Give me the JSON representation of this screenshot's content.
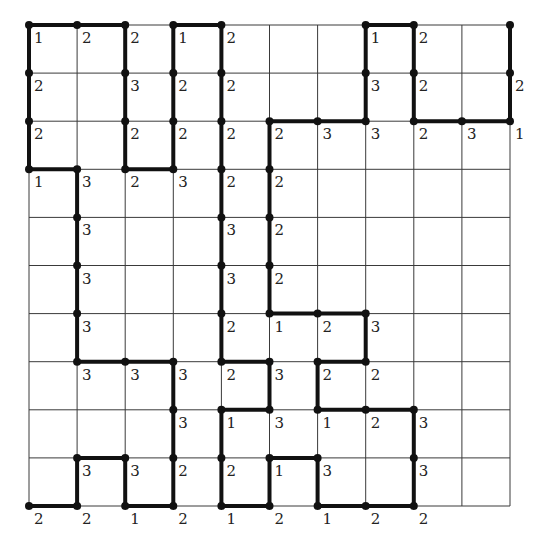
{
  "puzzle": {
    "type": "slitherlink-vertex-clues",
    "cols": 10,
    "rows": 10,
    "origin": [
      29,
      25
    ],
    "cell_size": 48.1,
    "colors": {
      "grid": "#3a3a3a",
      "path": "#111111",
      "text": "#222222",
      "background": "#ffffff"
    },
    "clues": [
      {
        "r": 0,
        "c": 0,
        "v": "1"
      },
      {
        "r": 0,
        "c": 1,
        "v": "2"
      },
      {
        "r": 0,
        "c": 2,
        "v": "2"
      },
      {
        "r": 0,
        "c": 3,
        "v": "1"
      },
      {
        "r": 0,
        "c": 4,
        "v": "2"
      },
      {
        "r": 0,
        "c": 7,
        "v": "1"
      },
      {
        "r": 0,
        "c": 8,
        "v": "2"
      },
      {
        "r": 1,
        "c": 0,
        "v": "2"
      },
      {
        "r": 1,
        "c": 2,
        "v": "3"
      },
      {
        "r": 1,
        "c": 3,
        "v": "2"
      },
      {
        "r": 1,
        "c": 4,
        "v": "2"
      },
      {
        "r": 1,
        "c": 7,
        "v": "3"
      },
      {
        "r": 1,
        "c": 8,
        "v": "2"
      },
      {
        "r": 1,
        "c": 10,
        "v": "2"
      },
      {
        "r": 2,
        "c": 0,
        "v": "2"
      },
      {
        "r": 2,
        "c": 2,
        "v": "2"
      },
      {
        "r": 2,
        "c": 3,
        "v": "2"
      },
      {
        "r": 2,
        "c": 4,
        "v": "2"
      },
      {
        "r": 2,
        "c": 5,
        "v": "2"
      },
      {
        "r": 2,
        "c": 6,
        "v": "3"
      },
      {
        "r": 2,
        "c": 7,
        "v": "3"
      },
      {
        "r": 2,
        "c": 8,
        "v": "2"
      },
      {
        "r": 2,
        "c": 9,
        "v": "3"
      },
      {
        "r": 2,
        "c": 10,
        "v": "1"
      },
      {
        "r": 3,
        "c": 0,
        "v": "1"
      },
      {
        "r": 3,
        "c": 1,
        "v": "3"
      },
      {
        "r": 3,
        "c": 2,
        "v": "2"
      },
      {
        "r": 3,
        "c": 3,
        "v": "3"
      },
      {
        "r": 3,
        "c": 4,
        "v": "2"
      },
      {
        "r": 3,
        "c": 5,
        "v": "2"
      },
      {
        "r": 4,
        "c": 1,
        "v": "3"
      },
      {
        "r": 4,
        "c": 4,
        "v": "3"
      },
      {
        "r": 4,
        "c": 5,
        "v": "2"
      },
      {
        "r": 5,
        "c": 1,
        "v": "3"
      },
      {
        "r": 5,
        "c": 4,
        "v": "3"
      },
      {
        "r": 5,
        "c": 5,
        "v": "2"
      },
      {
        "r": 6,
        "c": 1,
        "v": "3"
      },
      {
        "r": 6,
        "c": 4,
        "v": "2"
      },
      {
        "r": 6,
        "c": 5,
        "v": "1"
      },
      {
        "r": 6,
        "c": 6,
        "v": "2"
      },
      {
        "r": 6,
        "c": 7,
        "v": "3"
      },
      {
        "r": 7,
        "c": 1,
        "v": "3"
      },
      {
        "r": 7,
        "c": 2,
        "v": "3"
      },
      {
        "r": 7,
        "c": 3,
        "v": "3"
      },
      {
        "r": 7,
        "c": 4,
        "v": "2"
      },
      {
        "r": 7,
        "c": 5,
        "v": "3"
      },
      {
        "r": 7,
        "c": 6,
        "v": "2"
      },
      {
        "r": 7,
        "c": 7,
        "v": "2"
      },
      {
        "r": 8,
        "c": 3,
        "v": "3"
      },
      {
        "r": 8,
        "c": 4,
        "v": "1"
      },
      {
        "r": 8,
        "c": 5,
        "v": "3"
      },
      {
        "r": 8,
        "c": 6,
        "v": "1"
      },
      {
        "r": 8,
        "c": 7,
        "v": "2"
      },
      {
        "r": 8,
        "c": 8,
        "v": "3"
      },
      {
        "r": 9,
        "c": 1,
        "v": "3"
      },
      {
        "r": 9,
        "c": 2,
        "v": "3"
      },
      {
        "r": 9,
        "c": 3,
        "v": "2"
      },
      {
        "r": 9,
        "c": 4,
        "v": "2"
      },
      {
        "r": 9,
        "c": 5,
        "v": "1"
      },
      {
        "r": 9,
        "c": 6,
        "v": "3"
      },
      {
        "r": 9,
        "c": 8,
        "v": "3"
      },
      {
        "r": 10,
        "c": 0,
        "v": "2"
      },
      {
        "r": 10,
        "c": 1,
        "v": "2"
      },
      {
        "r": 10,
        "c": 2,
        "v": "1"
      },
      {
        "r": 10,
        "c": 3,
        "v": "2"
      },
      {
        "r": 10,
        "c": 4,
        "v": "1"
      },
      {
        "r": 10,
        "c": 5,
        "v": "2"
      },
      {
        "r": 10,
        "c": 6,
        "v": "1"
      },
      {
        "r": 10,
        "c": 7,
        "v": "2"
      },
      {
        "r": 10,
        "c": 8,
        "v": "2"
      }
    ],
    "horizontal_edges": [
      {
        "r": 0,
        "c1": 0,
        "c2": 2
      },
      {
        "r": 0,
        "c1": 3,
        "c2": 4
      },
      {
        "r": 0,
        "c1": 7,
        "c2": 8
      },
      {
        "r": 2,
        "c1": 5,
        "c2": 7
      },
      {
        "r": 2,
        "c1": 8,
        "c2": 10
      },
      {
        "r": 3,
        "c1": 0,
        "c2": 1
      },
      {
        "r": 3,
        "c1": 2,
        "c2": 3
      },
      {
        "r": 6,
        "c1": 5,
        "c2": 7
      },
      {
        "r": 7,
        "c1": 1,
        "c2": 3
      },
      {
        "r": 7,
        "c1": 4,
        "c2": 5
      },
      {
        "r": 7,
        "c1": 6,
        "c2": 7
      },
      {
        "r": 8,
        "c1": 4,
        "c2": 5
      },
      {
        "r": 8,
        "c1": 6,
        "c2": 8
      },
      {
        "r": 9,
        "c1": 1,
        "c2": 2
      },
      {
        "r": 9,
        "c1": 5,
        "c2": 6
      },
      {
        "r": 10,
        "c1": 0,
        "c2": 1
      },
      {
        "r": 10,
        "c1": 2,
        "c2": 3
      },
      {
        "r": 10,
        "c1": 4,
        "c2": 5
      },
      {
        "r": 10,
        "c1": 6,
        "c2": 8
      }
    ],
    "vertical_edges": [
      {
        "c": 0,
        "r1": 0,
        "r2": 3
      },
      {
        "c": 1,
        "r1": 3,
        "r2": 7
      },
      {
        "c": 1,
        "r1": 9,
        "r2": 10
      },
      {
        "c": 2,
        "r1": 0,
        "r2": 3
      },
      {
        "c": 2,
        "r1": 9,
        "r2": 10
      },
      {
        "c": 3,
        "r1": 0,
        "r2": 3
      },
      {
        "c": 3,
        "r1": 7,
        "r2": 10
      },
      {
        "c": 4,
        "r1": 0,
        "r2": 7
      },
      {
        "c": 4,
        "r1": 8,
        "r2": 10
      },
      {
        "c": 5,
        "r1": 2,
        "r2": 6
      },
      {
        "c": 5,
        "r1": 7,
        "r2": 8
      },
      {
        "c": 5,
        "r1": 9,
        "r2": 10
      },
      {
        "c": 6,
        "r1": 7,
        "r2": 8
      },
      {
        "c": 6,
        "r1": 9,
        "r2": 10
      },
      {
        "c": 7,
        "r1": 0,
        "r2": 2
      },
      {
        "c": 7,
        "r1": 6,
        "r2": 7
      },
      {
        "c": 8,
        "r1": 0,
        "r2": 2
      },
      {
        "c": 8,
        "r1": 8,
        "r2": 10
      },
      {
        "c": 10,
        "r1": 0,
        "r2": 2
      }
    ]
  }
}
